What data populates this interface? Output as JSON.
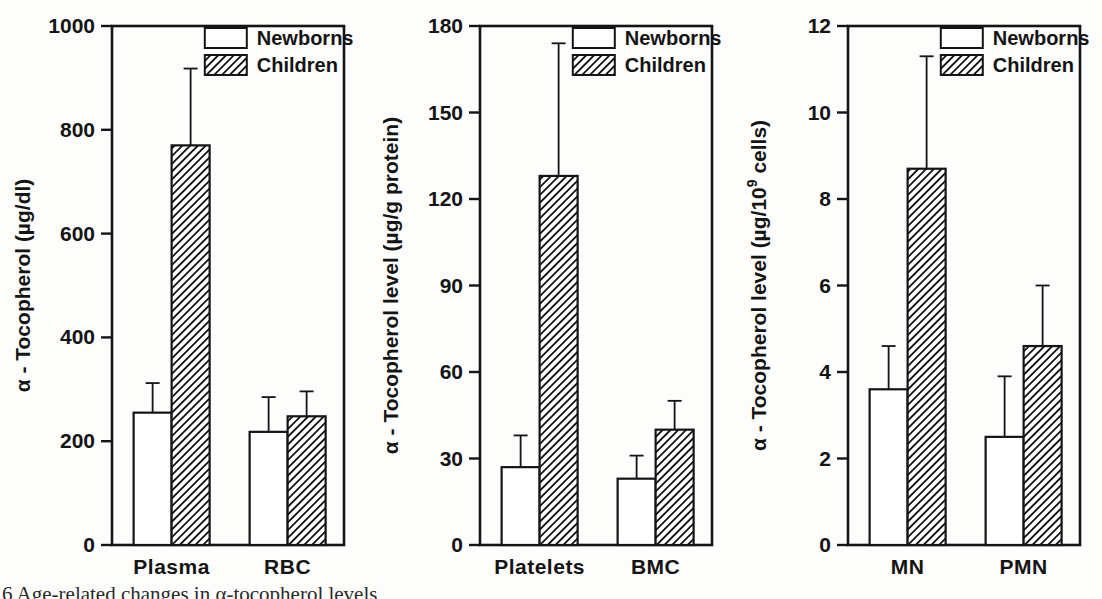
{
  "page": {
    "background": "#fdfdfc",
    "ink_color": "#141414"
  },
  "caption_fragment": {
    "text": "6 Age-related changes in α-tocopherol levels"
  },
  "chart_data": [
    {
      "type": "bar",
      "title": "",
      "ylabel": "α - Tocopherol (µg/dl)",
      "xlabel": "",
      "categories": [
        "Plasma",
        "RBC"
      ],
      "ylim": [
        0,
        1000
      ],
      "yticks": [
        0,
        200,
        400,
        600,
        800,
        1000
      ],
      "grid": false,
      "legend_position": "top-right",
      "legend": [
        "Newborns",
        "Children"
      ],
      "series": [
        {
          "name": "Newborns",
          "style": "open",
          "values": [
            255,
            218
          ],
          "errors": [
            57,
            67
          ]
        },
        {
          "name": "Children",
          "style": "hatched",
          "values": [
            770,
            248
          ],
          "errors": [
            148,
            48
          ]
        }
      ]
    },
    {
      "type": "bar",
      "title": "",
      "ylabel": "α - Tocopherol level (µg/g protein)",
      "xlabel": "",
      "categories": [
        "Platelets",
        "BMC"
      ],
      "ylim": [
        0,
        180
      ],
      "yticks": [
        0,
        30,
        60,
        90,
        120,
        150,
        180
      ],
      "grid": false,
      "legend_position": "top-right",
      "legend": [
        "Newborns",
        "Children"
      ],
      "series": [
        {
          "name": "Newborns",
          "style": "open",
          "values": [
            27,
            23
          ],
          "errors": [
            11,
            8
          ]
        },
        {
          "name": "Children",
          "style": "hatched",
          "values": [
            128,
            40
          ],
          "errors": [
            46,
            10
          ]
        }
      ]
    },
    {
      "type": "bar",
      "title": "",
      "ylabel": "α - Tocopherol level (µg/10⁹ cells)",
      "ylabel_parts": {
        "pre": "α - Tocopherol level (µg/10",
        "sup": "9",
        "post": " cells)"
      },
      "xlabel": "",
      "categories": [
        "MN",
        "PMN"
      ],
      "ylim": [
        0,
        12
      ],
      "yticks": [
        0,
        2,
        4,
        6,
        8,
        10,
        12
      ],
      "grid": false,
      "legend_position": "top-right",
      "legend": [
        "Newborns",
        "Children"
      ],
      "series": [
        {
          "name": "Newborns",
          "style": "open",
          "values": [
            3.6,
            2.5
          ],
          "errors": [
            1.0,
            1.4
          ]
        },
        {
          "name": "Children",
          "style": "hatched",
          "values": [
            8.7,
            4.6
          ],
          "errors": [
            2.6,
            1.4
          ]
        }
      ]
    }
  ]
}
